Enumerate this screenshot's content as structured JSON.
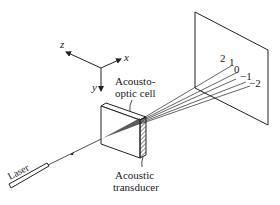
{
  "figure": {
    "axes": {
      "x_label": "x",
      "y_label": "y",
      "z_label": "z"
    },
    "labels": {
      "cell_line1": "Acousto-",
      "cell_line2": "optic cell",
      "transducer_line1": "Acoustic",
      "transducer_line2": "transducer",
      "laser": "Laser"
    },
    "orders": [
      {
        "label": "2"
      },
      {
        "label": "1"
      },
      {
        "label": "0"
      },
      {
        "label": "−1"
      },
      {
        "label": "−2"
      }
    ],
    "colors": {
      "line": "#222222",
      "background": "#ffffff"
    }
  }
}
